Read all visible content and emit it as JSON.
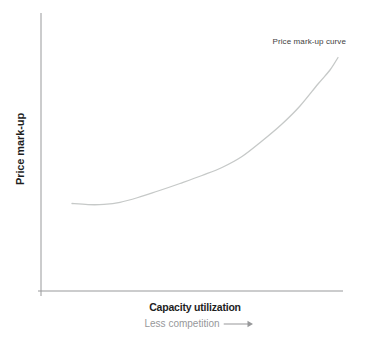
{
  "chart_data": {
    "type": "line",
    "title": "",
    "xlabel": "Capacity utilization",
    "xlabel_secondary": "Less competition",
    "xlabel_secondary_arrow": "long-right-arrow",
    "ylabel": "Price mark-up",
    "x_ticks": [],
    "y_ticks": [],
    "grid": false,
    "legend": false,
    "annotations": [
      {
        "text": "Price mark-up curve",
        "position": "above-upper-end-of-curve"
      }
    ],
    "series": [
      {
        "name": "Price mark-up curve",
        "shape": "convex-increasing",
        "points_px": [
          [
            72,
            203.5
          ],
          [
            88,
            204.6
          ],
          [
            104,
            204.4
          ],
          [
            120,
            202.3
          ],
          [
            138,
            197.5
          ],
          [
            158,
            191
          ],
          [
            180,
            183.5
          ],
          [
            202,
            175.5
          ],
          [
            222,
            167.5
          ],
          [
            242,
            156.5
          ],
          [
            262,
            141
          ],
          [
            282,
            124
          ],
          [
            300,
            106
          ],
          [
            318,
            84
          ],
          [
            330,
            70
          ],
          [
            338,
            57.5
          ]
        ]
      }
    ],
    "axes_px": {
      "x_axis": {
        "x1": 38,
        "y1": 291,
        "x2": 343,
        "y2": 291
      },
      "y_axis": {
        "x1": 41,
        "y1": 13,
        "x2": 41,
        "y2": 296
      }
    }
  },
  "colors": {
    "background": "#ffffff",
    "axis": "#98999b",
    "curve": "#c6c9c8",
    "label_dark": "#1e1e1e",
    "annotation": "#3e3e40",
    "secondary_text": "#97989a"
  }
}
